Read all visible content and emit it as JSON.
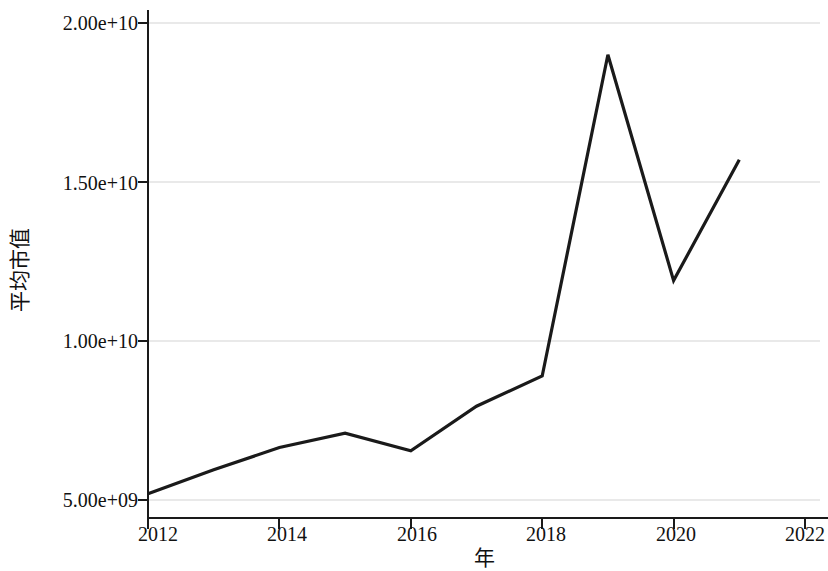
{
  "chart_data": {
    "type": "line",
    "title": "",
    "subtitle": "",
    "xlabel": "年",
    "ylabel": "平均市值",
    "x": [
      2012,
      2013,
      2014,
      2015,
      2016,
      2017,
      2018,
      2019,
      2020,
      2021
    ],
    "values": [
      5200000000,
      5950000000,
      6650000000,
      7100000000,
      6550000000,
      7950000000,
      8900000000,
      19000000000,
      11900000000,
      15700000000
    ],
    "series": [
      {
        "name": "平均市值",
        "values": [
          5200000000,
          5950000000,
          6650000000,
          7100000000,
          6550000000,
          7950000000,
          8900000000,
          19000000000,
          11900000000,
          15700000000
        ]
      }
    ],
    "xlim": [
      2012,
      2022
    ],
    "ylim": [
      5000000000,
      20000000000
    ],
    "xticks": [
      2012,
      2014,
      2016,
      2018,
      2020,
      2022
    ],
    "xtick_labels": [
      "2012",
      "2014",
      "2016",
      "2018",
      "2020",
      "2022"
    ],
    "yticks": [
      5000000000,
      10000000000,
      15000000000,
      20000000000
    ],
    "ytick_labels": [
      "5.00e+09",
      "1.00e+10",
      "1.50e+10",
      "2.00e+10"
    ],
    "grid": "horizontal",
    "legend": "none",
    "line_color": "#1a1a1a",
    "grid_color": "#e9e9e9",
    "axis_color": "#1a1a1a",
    "background_color": "#ffffff"
  }
}
